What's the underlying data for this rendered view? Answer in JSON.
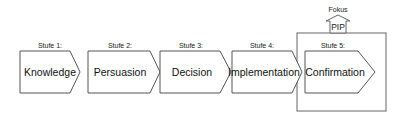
{
  "diagram": {
    "stages": [
      {
        "label": "Stufe 1:",
        "name": "Knowledge"
      },
      {
        "label": "Stufe 2:",
        "name": "Persuasion"
      },
      {
        "label": "Stufe 3:",
        "name": "Decision"
      },
      {
        "label": "Stufe 4:",
        "name": "Implementation"
      },
      {
        "label": "Stufe 5:",
        "name": "Confirmation"
      }
    ],
    "focus": {
      "caption": "Fokus",
      "arrow_label": "PIP"
    },
    "colors": {
      "stroke": "#555555",
      "fill": "#ffffff",
      "text": "#111111"
    }
  }
}
